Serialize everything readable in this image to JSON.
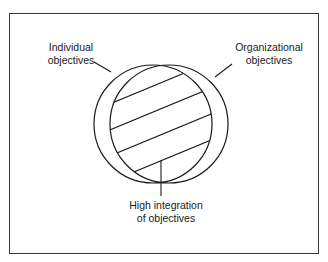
{
  "diagram": {
    "type": "overlapping-circles",
    "labels": {
      "individual": [
        "Individual",
        "objectives"
      ],
      "organizational": [
        "Organizational",
        "objectives"
      ],
      "integration": [
        "High integration",
        "of objectives"
      ]
    },
    "colors": {
      "stroke": "#1a1a1a",
      "frame": "#3a3a3a",
      "background": "#ffffff"
    }
  }
}
